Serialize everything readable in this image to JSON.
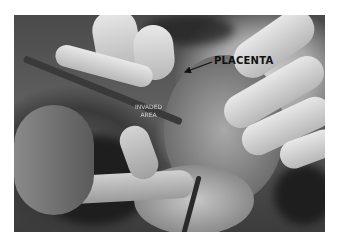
{
  "figure": {
    "type": "grayscale surgical photograph",
    "labels": {
      "placenta": "PLACENTA",
      "invaded_line1": "INVADED",
      "invaded_line2": "AREA"
    },
    "colors": {
      "background": "#ffffff",
      "label_dark": "#111111",
      "label_light": "#e6e6e6"
    }
  }
}
